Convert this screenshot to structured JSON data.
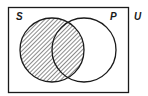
{
  "diagram": {
    "type": "venn",
    "universe_label": "U",
    "sets": [
      {
        "label": "S",
        "shaded": true
      },
      {
        "label": "P",
        "shaded": false
      }
    ],
    "shaded_region": "S (entire set S hatched, including S∩P)",
    "colors": {
      "stroke": "#1a1a1a",
      "background": "#ffffff"
    }
  }
}
